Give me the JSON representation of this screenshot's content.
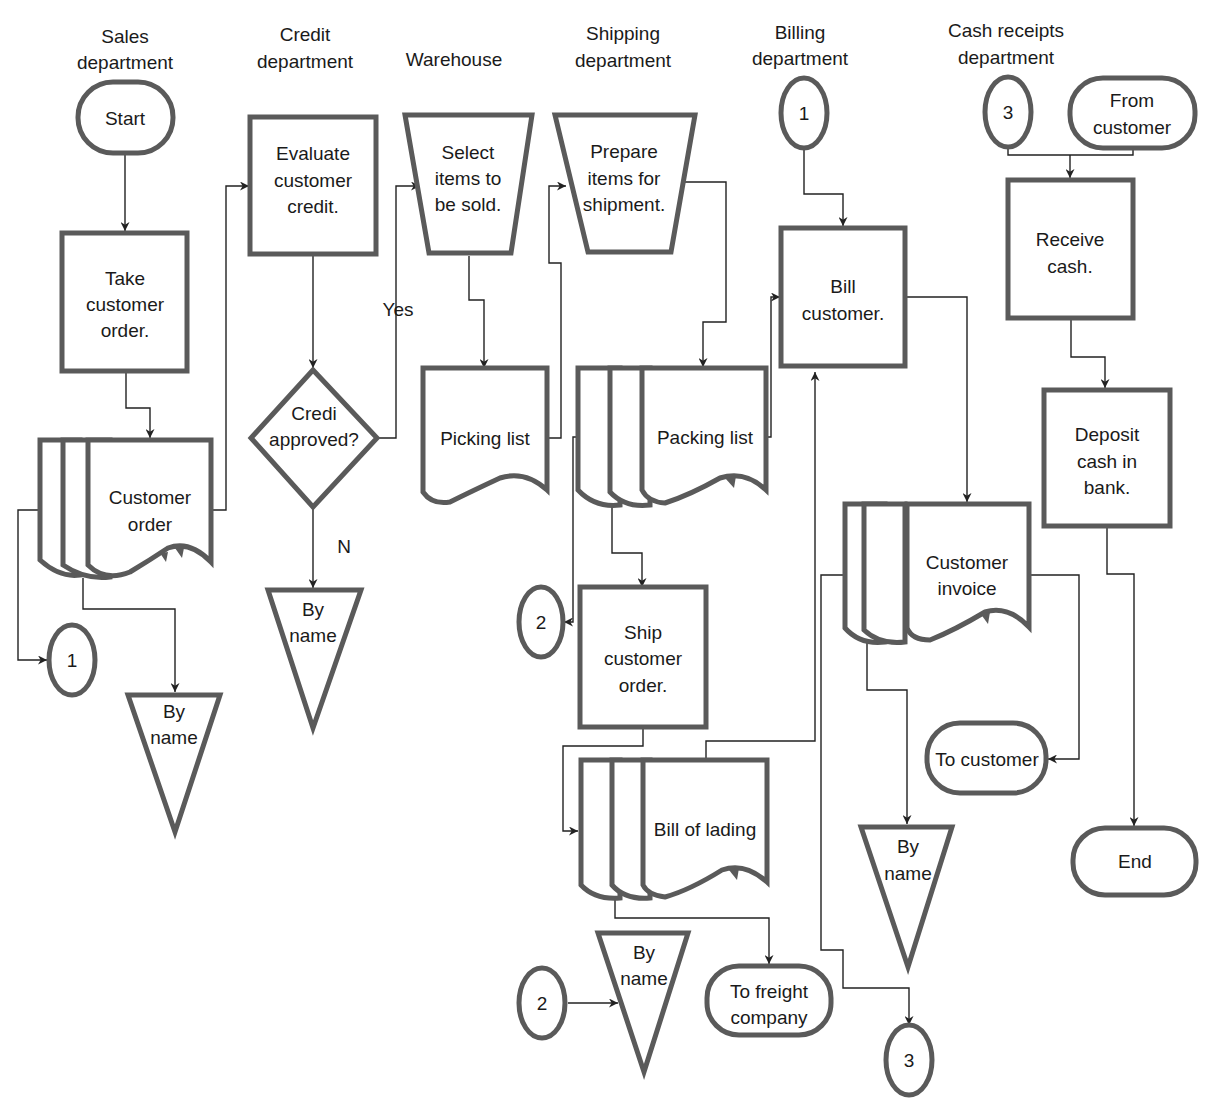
{
  "diagram": {
    "type": "document-flowchart",
    "title_hidden": "Sales and cash receipts process flowchart",
    "departments": [
      {
        "id": "sales",
        "line1": "Sales",
        "line2": "department"
      },
      {
        "id": "credit",
        "line1": "Credit",
        "line2": "department"
      },
      {
        "id": "warehouse",
        "line1": "Warehouse",
        "line2": ""
      },
      {
        "id": "shipping",
        "line1": "Shipping",
        "line2": "department"
      },
      {
        "id": "billing",
        "line1": "Billing",
        "line2": "department"
      },
      {
        "id": "cash",
        "line1": "Cash receipts",
        "line2": "department"
      }
    ],
    "nodes": {
      "start": {
        "shape": "terminal",
        "lines": [
          "Start"
        ]
      },
      "take_order": {
        "shape": "process",
        "lines": [
          "Take",
          "customer",
          "order."
        ]
      },
      "customer_order": {
        "shape": "multi-document",
        "lines": [
          "Customer",
          "order"
        ]
      },
      "conn1_sales": {
        "shape": "connector",
        "lines": [
          "1"
        ]
      },
      "file_sales": {
        "shape": "file",
        "lines": [
          "By",
          "name"
        ]
      },
      "evaluate_credit": {
        "shape": "process",
        "lines": [
          "Evaluate",
          "customer",
          "credit."
        ]
      },
      "credit_decision": {
        "shape": "decision",
        "lines": [
          "Credi",
          "approved?"
        ]
      },
      "label_yes": {
        "shape": "label",
        "lines": [
          "Yes"
        ]
      },
      "label_no": {
        "shape": "label",
        "lines": [
          "N"
        ]
      },
      "file_credit": {
        "shape": "file",
        "lines": [
          "By",
          "name"
        ]
      },
      "select_items": {
        "shape": "manual-operation",
        "lines": [
          "Select",
          "items to",
          "be sold."
        ]
      },
      "picking_list": {
        "shape": "document",
        "lines": [
          "Picking list"
        ]
      },
      "prepare_items": {
        "shape": "manual-operation",
        "lines": [
          "Prepare",
          "items for",
          "shipment."
        ]
      },
      "packing_list": {
        "shape": "multi-document",
        "lines": [
          "Packing list"
        ]
      },
      "conn2_ship_top": {
        "shape": "connector",
        "lines": [
          "2"
        ]
      },
      "ship_order": {
        "shape": "process",
        "lines": [
          "Ship",
          "customer",
          "order."
        ]
      },
      "bill_of_lading": {
        "shape": "multi-document",
        "lines": [
          "Bill of lading"
        ]
      },
      "conn2_ship_bottom": {
        "shape": "connector",
        "lines": [
          "2"
        ]
      },
      "file_shipping": {
        "shape": "file",
        "lines": [
          "By",
          "name"
        ]
      },
      "to_freight": {
        "shape": "terminal",
        "lines": [
          "To freight",
          "company"
        ]
      },
      "conn1_billing": {
        "shape": "connector",
        "lines": [
          "1"
        ]
      },
      "bill_customer": {
        "shape": "process",
        "lines": [
          "Bill",
          "customer."
        ]
      },
      "customer_invoice": {
        "shape": "multi-document",
        "lines": [
          "Customer",
          "invoice"
        ]
      },
      "to_customer": {
        "shape": "terminal",
        "lines": [
          "To customer"
        ]
      },
      "file_billing": {
        "shape": "file",
        "lines": [
          "By",
          "name"
        ]
      },
      "conn3_billing": {
        "shape": "connector",
        "lines": [
          "3"
        ]
      },
      "conn3_cash": {
        "shape": "connector",
        "lines": [
          "3"
        ]
      },
      "from_customer": {
        "shape": "terminal",
        "lines": [
          "From",
          "customer"
        ]
      },
      "receive_cash": {
        "shape": "process",
        "lines": [
          "Receive",
          "cash."
        ]
      },
      "deposit_cash": {
        "shape": "process",
        "lines": [
          "Deposit",
          "cash in",
          "bank."
        ]
      },
      "end": {
        "shape": "terminal",
        "lines": [
          "End"
        ]
      }
    },
    "edges": [
      [
        "start",
        "take_order"
      ],
      [
        "take_order",
        "customer_order"
      ],
      [
        "customer_order",
        "evaluate_credit"
      ],
      [
        "customer_order",
        "conn1_sales"
      ],
      [
        "customer_order",
        "file_sales"
      ],
      [
        "evaluate_credit",
        "credit_decision"
      ],
      [
        "credit_decision",
        "select_items",
        "Yes"
      ],
      [
        "credit_decision",
        "file_credit",
        "N"
      ],
      [
        "select_items",
        "picking_list"
      ],
      [
        "picking_list",
        "prepare_items"
      ],
      [
        "prepare_items",
        "packing_list"
      ],
      [
        "packing_list",
        "bill_customer"
      ],
      [
        "packing_list",
        "ship_order"
      ],
      [
        "packing_list",
        "conn2_ship_top"
      ],
      [
        "ship_order",
        "bill_of_lading"
      ],
      [
        "bill_of_lading",
        "bill_customer"
      ],
      [
        "bill_of_lading",
        "to_freight"
      ],
      [
        "conn2_ship_bottom",
        "file_shipping"
      ],
      [
        "conn1_billing",
        "bill_customer"
      ],
      [
        "bill_customer",
        "customer_invoice"
      ],
      [
        "customer_invoice",
        "to_customer"
      ],
      [
        "customer_invoice",
        "file_billing"
      ],
      [
        "customer_invoice",
        "conn3_billing"
      ],
      [
        "conn3_cash",
        "receive_cash"
      ],
      [
        "from_customer",
        "receive_cash"
      ],
      [
        "receive_cash",
        "deposit_cash"
      ],
      [
        "deposit_cash",
        "end"
      ]
    ],
    "colors": {
      "shape_stroke": "#5a5a5a",
      "line": "#222222",
      "text": "#1a1a1a",
      "background": "#ffffff"
    }
  }
}
